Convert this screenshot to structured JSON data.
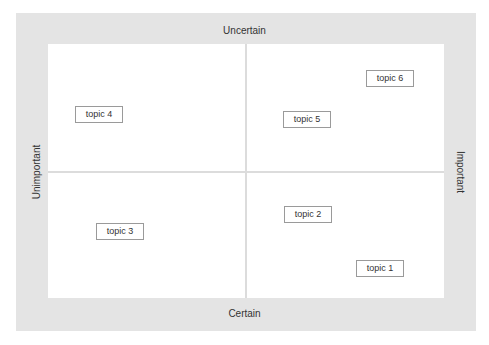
{
  "axes": {
    "top": "Uncertain",
    "bottom": "Certain",
    "left": "Unimportant",
    "right": "Important"
  },
  "topics": [
    {
      "label": "topic 1",
      "x": 356,
      "y": 260
    },
    {
      "label": "topic 2",
      "x": 284,
      "y": 206
    },
    {
      "label": "topic 3",
      "x": 96,
      "y": 223
    },
    {
      "label": "topic 4",
      "x": 75,
      "y": 106
    },
    {
      "label": "topic 5",
      "x": 283,
      "y": 111
    },
    {
      "label": "topic 6",
      "x": 366,
      "y": 70
    }
  ],
  "colors": {
    "frame": "#e4e4e4",
    "plot": "#ffffff",
    "divider": "#dcdcdc",
    "box_border": "#9a9a9a",
    "text": "#333333"
  }
}
